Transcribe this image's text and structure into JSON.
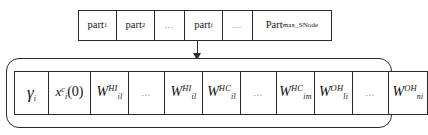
{
  "diagram": {
    "partition_row": {
      "name": "partition-array",
      "cells": [
        {
          "id": "part-1",
          "base": "part",
          "sub": "1",
          "type": "label"
        },
        {
          "id": "part-2",
          "base": "part",
          "sub": "2",
          "type": "label"
        },
        {
          "id": "part-gap-1",
          "base": "…",
          "sub": "",
          "type": "ellipsis"
        },
        {
          "id": "part-i",
          "base": "part",
          "sub": "i",
          "type": "label"
        },
        {
          "id": "part-gap-2",
          "base": "…",
          "sub": "",
          "type": "ellipsis"
        },
        {
          "id": "part-max",
          "base": "Part",
          "sub": "max_SNode",
          "type": "label"
        }
      ]
    },
    "arrow": {
      "name": "expand-arrow",
      "from": "part-i",
      "to": "gene-row",
      "direction": "down"
    },
    "gene_row": {
      "name": "gene-array",
      "cells": [
        {
          "id": "gene-gamma",
          "base": "γ",
          "sub": "i",
          "sup": "",
          "suffix": "",
          "type": "gamma"
        },
        {
          "id": "gene-x0",
          "base": "x",
          "sub": "i",
          "sup": "c",
          "suffix": "(0)",
          "type": "state"
        },
        {
          "id": "gene-w-hi-1",
          "base": "W",
          "sub": "il",
          "sup": "HI",
          "suffix": "",
          "type": "weight"
        },
        {
          "id": "gene-gap-1",
          "base": "…",
          "sub": "",
          "sup": "",
          "suffix": "",
          "type": "ellipsis"
        },
        {
          "id": "gene-w-hi-2",
          "base": "W",
          "sub": "il",
          "sup": "HI",
          "suffix": "",
          "type": "weight"
        },
        {
          "id": "gene-w-hc-1",
          "base": "W",
          "sub": "il",
          "sup": "HC",
          "suffix": "",
          "type": "weight"
        },
        {
          "id": "gene-gap-2",
          "base": "…",
          "sub": "",
          "sup": "",
          "suffix": "",
          "type": "ellipsis"
        },
        {
          "id": "gene-w-hc-2",
          "base": "W",
          "sub": "im",
          "sup": "HC",
          "suffix": "",
          "type": "weight"
        },
        {
          "id": "gene-w-oh-1",
          "base": "W",
          "sub": "li",
          "sup": "OH",
          "suffix": "",
          "type": "weight"
        },
        {
          "id": "gene-gap-3",
          "base": "…",
          "sub": "",
          "sup": "",
          "suffix": "",
          "type": "ellipsis"
        },
        {
          "id": "gene-w-oh-2",
          "base": "W",
          "sub": "ni",
          "sup": "OH",
          "suffix": "",
          "type": "weight"
        }
      ]
    },
    "colors": {
      "stroke": "#2b2b2b",
      "text": "#131313",
      "background": "#ffffff",
      "ellipsis": "#555555"
    }
  }
}
